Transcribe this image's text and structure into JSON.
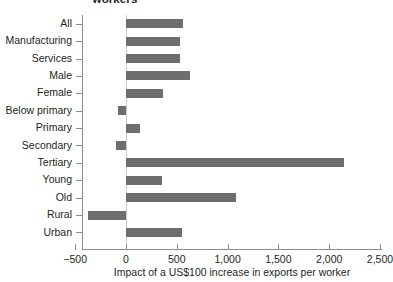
{
  "chart_data": {
    "type": "bar",
    "orientation": "horizontal",
    "title": "workers",
    "xlabel": "Impact of a US$100 increase in exports per worker",
    "ylabel": "",
    "xlim": [
      -500,
      2500
    ],
    "xticks": [
      -500,
      0,
      500,
      1000,
      1500,
      2000,
      2500
    ],
    "xtick_labels": [
      "−500",
      "0",
      "500",
      "1,000",
      "1,500",
      "2,000",
      "2,500"
    ],
    "grid": false,
    "legend": null,
    "bar_color": "#6e6e6e",
    "axis_color": "#8c8c8c",
    "zero_line_color": "#cfcfcf",
    "categories": [
      "All",
      "Manufacturing",
      "Services",
      "Male",
      "Female",
      "Below primary",
      "Primary",
      "Secondary",
      "Tertiary",
      "Young",
      "Old",
      "Rural",
      "Urban"
    ],
    "values": [
      560,
      530,
      530,
      630,
      360,
      -80,
      140,
      -100,
      2150,
      350,
      1080,
      -370,
      555
    ]
  }
}
